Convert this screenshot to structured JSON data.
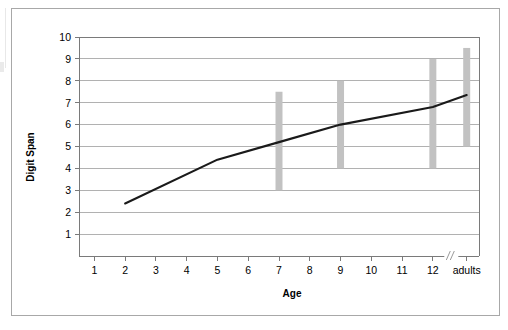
{
  "figure": {
    "background_color": "#ffffff",
    "frame_color": "#a8a8a8"
  },
  "chart_data": {
    "type": "line",
    "title": "",
    "xlabel": "Age",
    "ylabel": "Digit Span",
    "grid": true,
    "legend": false,
    "xlim": [
      0.5,
      13.5
    ],
    "ylim": [
      0,
      10
    ],
    "ytick_labels": [
      "1",
      "2",
      "3",
      "4",
      "5",
      "6",
      "7",
      "8",
      "9",
      "10"
    ],
    "ytick_values": [
      1,
      2,
      3,
      4,
      5,
      6,
      7,
      8,
      9,
      10
    ],
    "xtick_labels": [
      "1",
      "2",
      "3",
      "4",
      "5",
      "6",
      "7",
      "8",
      "9",
      "10",
      "11",
      "12",
      "adults"
    ],
    "xtick_positions": [
      1,
      2,
      3,
      4,
      5,
      6,
      7,
      8,
      9,
      10,
      11,
      12,
      13.1
    ],
    "axis_break": {
      "present": true,
      "position": 12.6,
      "symbol": "//"
    },
    "series": [
      {
        "name": "Digit Span",
        "color": "#1a1a1a",
        "x": [
          2,
          5,
          7,
          9,
          12,
          13.1
        ],
        "x_labels": [
          "2",
          "5",
          "7",
          "9",
          "12",
          "adults"
        ],
        "values": [
          2.4,
          4.4,
          5.2,
          6.0,
          6.8,
          7.35
        ]
      }
    ],
    "error_bars": {
      "color": "#c2c2c2",
      "width_px": 7,
      "bars": [
        {
          "x": 7,
          "x_label": "7",
          "low": 3.0,
          "high": 7.5
        },
        {
          "x": 9,
          "x_label": "9",
          "low": 4.0,
          "high": 8.0
        },
        {
          "x": 12,
          "x_label": "12",
          "low": 4.0,
          "high": 9.0
        },
        {
          "x": 13.1,
          "x_label": "adults",
          "low": 5.0,
          "high": 9.5
        }
      ]
    }
  }
}
